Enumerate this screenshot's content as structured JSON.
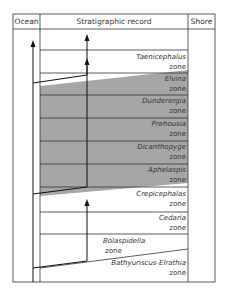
{
  "header": {
    "ocean": "Ocean",
    "record": "Stratigraphic record",
    "shore": "Shore"
  },
  "zones": [
    {
      "name": "Taenicephalus",
      "suffix": "zone",
      "shaded": false
    },
    {
      "name": "Elvina",
      "suffix": "zone",
      "shaded": true
    },
    {
      "name": "Dunderergia",
      "suffix": "zone",
      "shaded": true
    },
    {
      "name": "Prehousia",
      "suffix": "zone",
      "shaded": true
    },
    {
      "name": "Dicanthopyge",
      "suffix": "zone",
      "shaded": true
    },
    {
      "name": "Aphelaspis",
      "suffix": "zone",
      "shaded": true
    },
    {
      "name": "Crepicephalas",
      "suffix": "zone",
      "shaded": false
    },
    {
      "name": "Cedaria",
      "suffix": "zone",
      "shaded": false
    },
    {
      "name": "Bolaspidella",
      "suffix": "zone",
      "shaded": false
    },
    {
      "name": "Bathyuriscus-Elrathia",
      "suffix": "zone",
      "shaded": false
    }
  ],
  "colors": {
    "shade": "#a6a6a6",
    "line": "#333333"
  }
}
